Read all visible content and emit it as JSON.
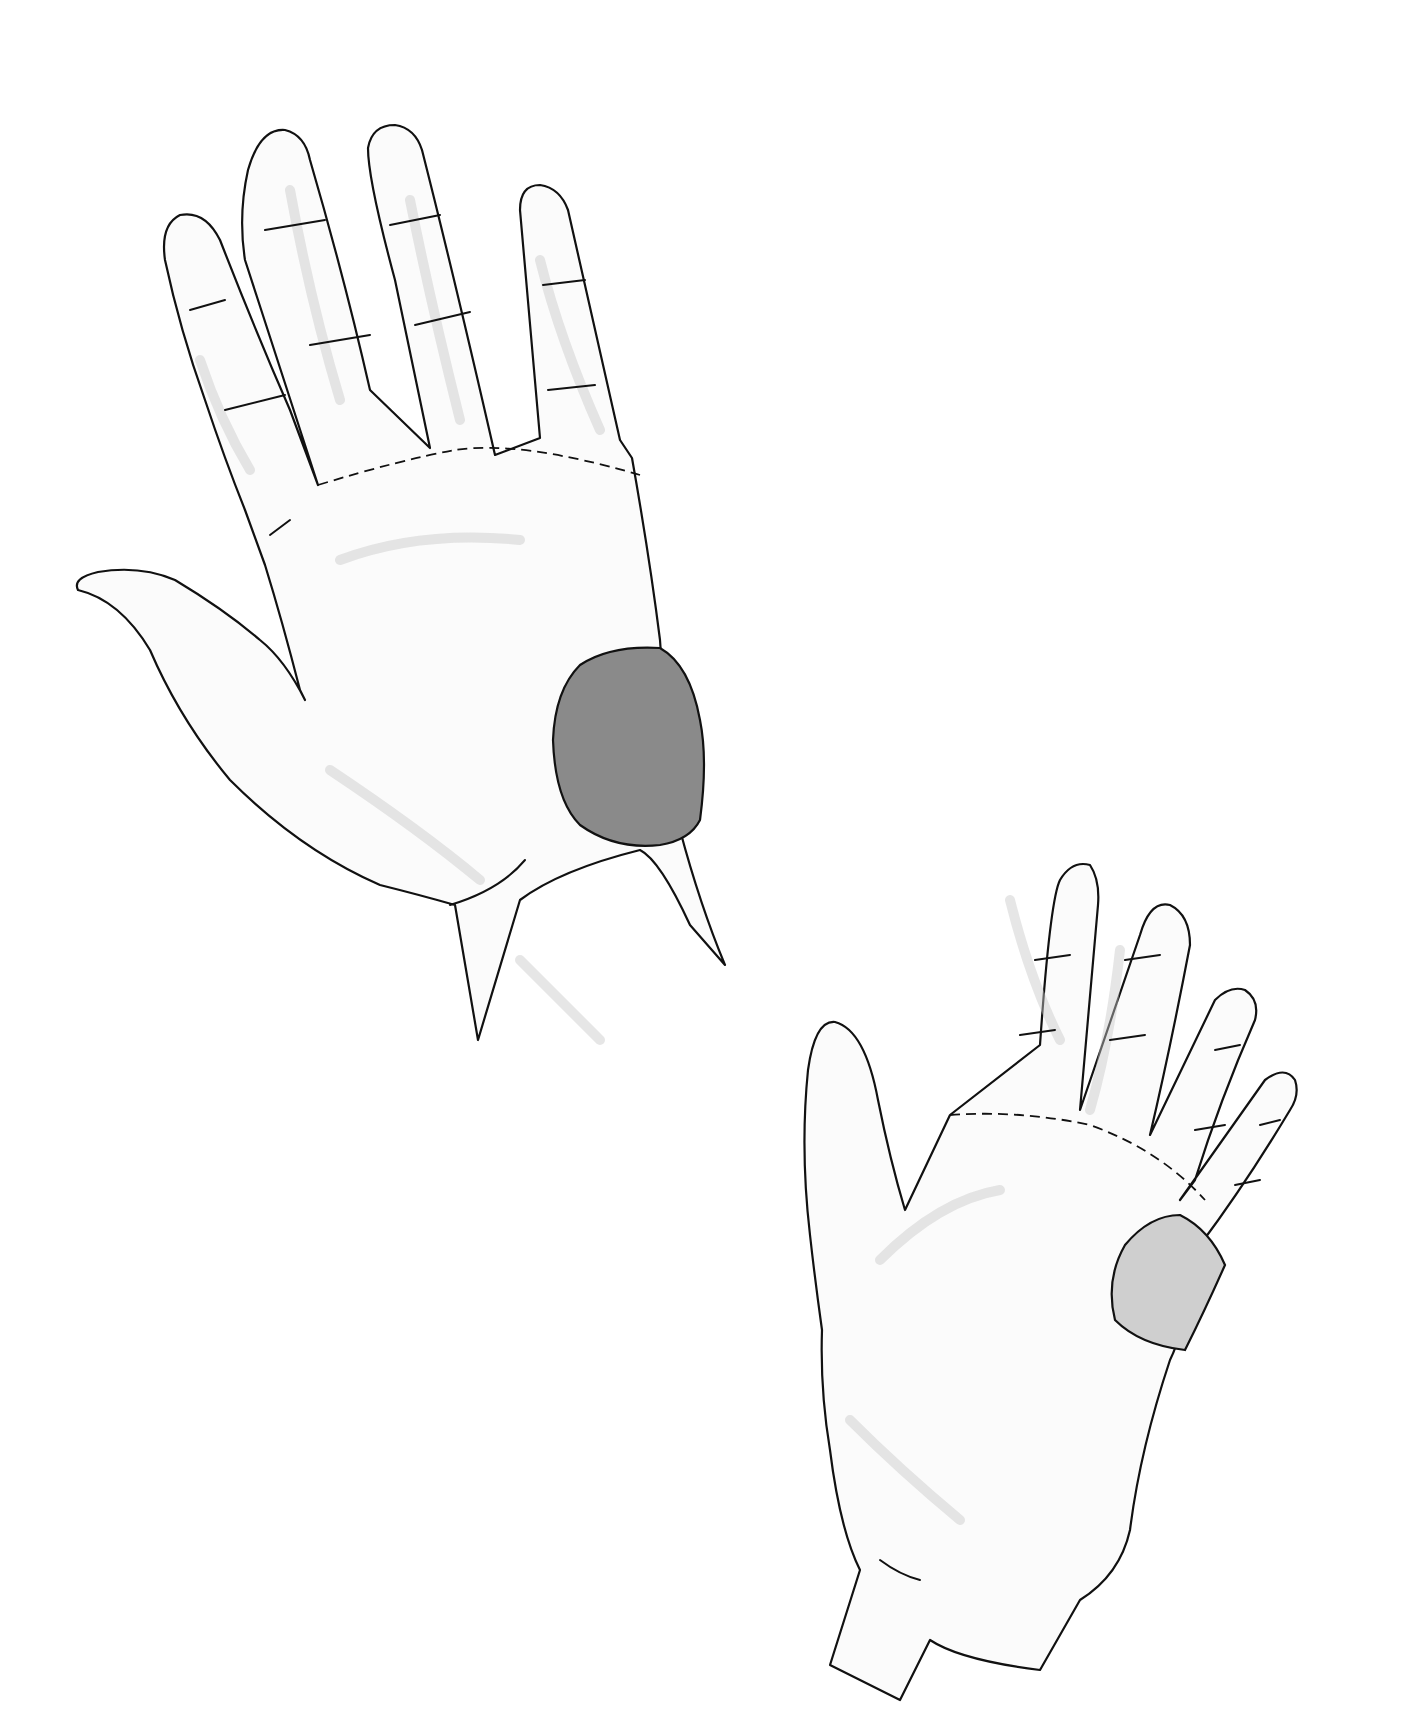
{
  "figure": {
    "hands": [
      {
        "id": "left-hand-large",
        "highlight_color": "#8a8a8a",
        "highlight_region": "hypothenar eminence"
      },
      {
        "id": "right-hand-small",
        "highlight_color": "#cfcfcf",
        "highlight_region": "hypothenar eminence"
      }
    ],
    "colors": {
      "background": "#ffffff",
      "outline": "#111111",
      "sketch_shading": "#c8c8c8"
    }
  }
}
